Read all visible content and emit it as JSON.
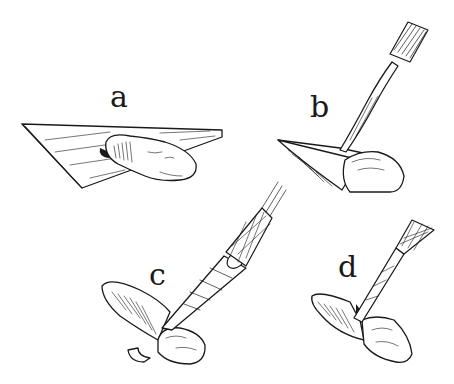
{
  "figure": {
    "background": "#ffffff",
    "ink_color": "#1a1a1a",
    "panels": [
      {
        "id": "a",
        "label": "a",
        "description": "tissue piece resting on flat triangular plate"
      },
      {
        "id": "b",
        "label": "b",
        "description": "tool with ridged grip pressing on plate tip against tissue"
      },
      {
        "id": "c",
        "label": "c",
        "description": "cross-hatched handle instrument cutting tissue at folded plate"
      },
      {
        "id": "d",
        "label": "d",
        "description": "smaller cross-hatched instrument pressing at folded plate tip"
      }
    ]
  }
}
